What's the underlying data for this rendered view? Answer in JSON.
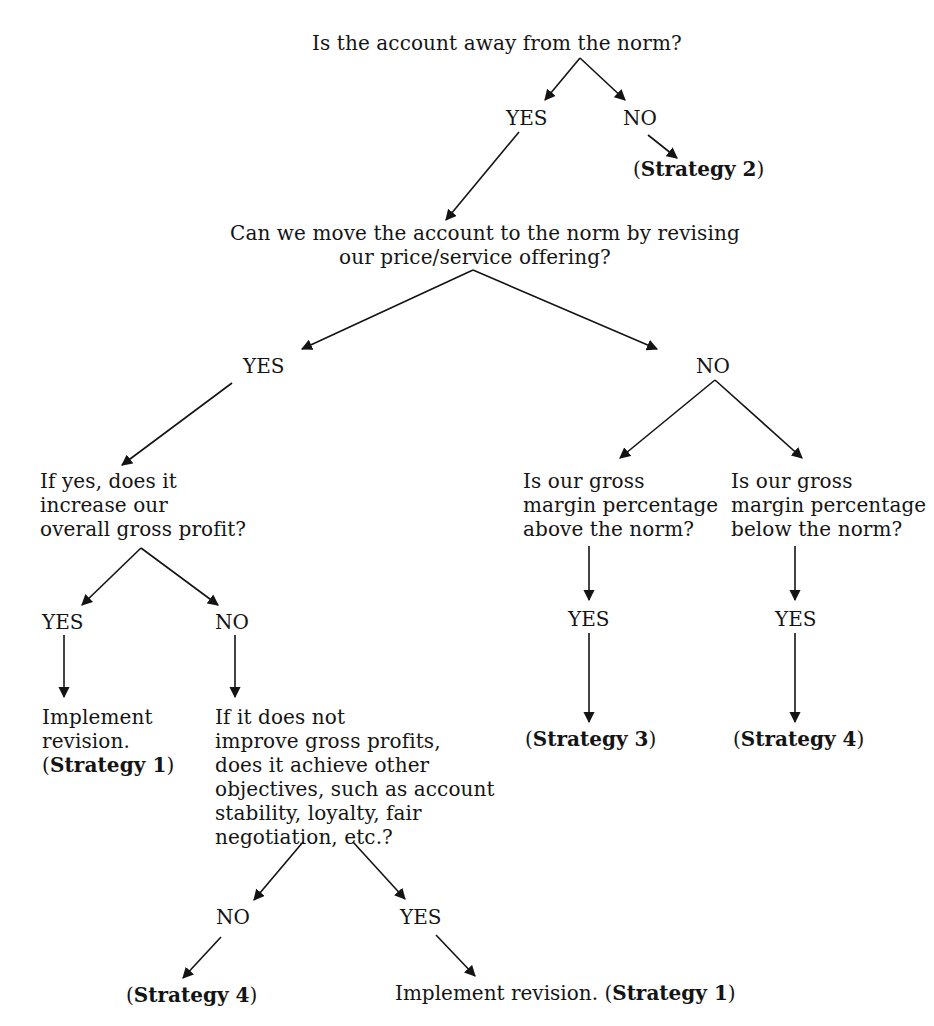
{
  "figure": {
    "cut_off_header_visible": true,
    "root": {
      "question": "Is the account away from the norm?",
      "yes_label": "YES",
      "no_label": "NO",
      "no_outcome": {
        "prefix": "(",
        "strategy": "Strategy 2",
        "suffix": ")"
      }
    },
    "q2": {
      "line1": "Can we move the account to the norm by revising",
      "line2": "our price/service offering?",
      "yes_label": "YES",
      "no_label": "NO"
    },
    "yes_branch": {
      "question_lines": [
        "If yes, does it",
        "increase our",
        "overall gross profit?"
      ],
      "yes_label": "YES",
      "no_label": "NO",
      "yes_outcome": {
        "line1": "Implement",
        "line2": "revision.",
        "prefix": "(",
        "strategy": "Strategy 1",
        "suffix": ")"
      },
      "no_question_lines": [
        "If it does not",
        "improve gross profits,",
        "does it achieve other",
        "objectives, such as account",
        "stability, loyalty, fair",
        "negotiation, etc.?"
      ],
      "no_no_label": "NO",
      "no_yes_label": "YES",
      "no_no_outcome": {
        "prefix": "(",
        "strategy": "Strategy 4",
        "suffix": ")"
      },
      "no_yes_outcome": {
        "text": "Implement revision. ",
        "prefix": "(",
        "strategy": "Strategy 1",
        "suffix": ")"
      }
    },
    "no_branch": {
      "left_question_lines": [
        "Is our gross",
        "margin percentage",
        "above the norm?"
      ],
      "right_question_lines": [
        "Is our gross",
        "margin percentage",
        "below the norm?"
      ],
      "left_yes_label": "YES",
      "right_yes_label": "YES",
      "left_outcome": {
        "prefix": "(",
        "strategy": "Strategy 3",
        "suffix": ")"
      },
      "right_outcome": {
        "prefix": "(",
        "strategy": "Strategy 4",
        "suffix": ")"
      }
    },
    "colors": {
      "ink": "#141414",
      "background": "#ffffff"
    }
  }
}
